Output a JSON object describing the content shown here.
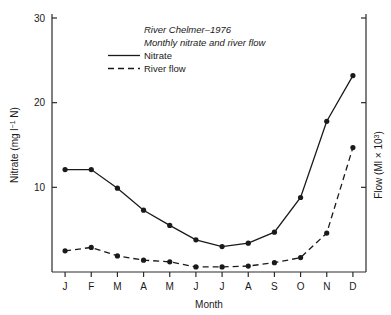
{
  "chart_data": {
    "type": "line",
    "title": "River Chelmer–1976",
    "subtitle": "Monthly nitrate and river flow",
    "xlabel": "Month",
    "ylabel": "Nitrate (mg l⁻¹ N)",
    "ylabel_right": "Flow (Ml × 10³)",
    "categories": [
      "J",
      "F",
      "M",
      "A",
      "M",
      "J",
      "J",
      "A",
      "S",
      "O",
      "N",
      "D"
    ],
    "x_tick_labels": [
      "J",
      "F",
      "M",
      "A",
      "M",
      "J",
      "J",
      "A",
      "S",
      "O",
      "N",
      "D"
    ],
    "y_tick_labels": [
      "10",
      "20",
      "30"
    ],
    "y_ticks": [
      10,
      20,
      30
    ],
    "ylim": [
      0,
      30
    ],
    "ylim_right": [
      0,
      30
    ],
    "y_right_ticks": [
      10,
      20,
      30
    ],
    "y_right_tick_labels": [
      "",
      "",
      ""
    ],
    "grid": false,
    "legend_position": "upper-left-inside",
    "series": [
      {
        "name": "Nitrate",
        "style": "solid",
        "marker": "filled-circle",
        "values": [
          12.1,
          12.1,
          9.9,
          7.3,
          5.5,
          3.8,
          3.0,
          3.4,
          4.7,
          8.8,
          17.8,
          23.2
        ]
      },
      {
        "name": "River flow",
        "style": "dashed",
        "marker": "filled-circle",
        "values": [
          2.5,
          2.9,
          1.9,
          1.4,
          1.2,
          0.6,
          0.6,
          0.7,
          1.1,
          1.7,
          4.6,
          14.7
        ]
      }
    ]
  },
  "legend": {
    "entries": [
      {
        "label": "Nitrate",
        "style": "solid"
      },
      {
        "label": "River flow",
        "style": "dashed"
      }
    ]
  },
  "axes": {
    "left_title": "Nitrate (mg l⁻¹ N)",
    "right_title": "Flow (Ml × 10³)",
    "bottom_title": "Month"
  }
}
